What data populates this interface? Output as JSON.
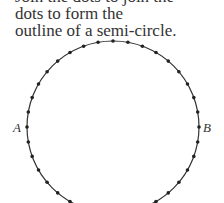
{
  "caption": {
    "lines": [
      "Join the dots to join the",
      "dots to form the",
      "outline of a semi-circle."
    ]
  },
  "diagram": {
    "circle": {
      "cx": 113,
      "cy": 127,
      "r": 86,
      "stroke": "#333333"
    },
    "dot_count": 36,
    "dot_color": "#222222",
    "labels": {
      "left": "A",
      "right": "B"
    }
  }
}
